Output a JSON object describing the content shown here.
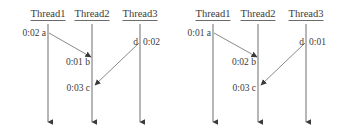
{
  "figure": {
    "type": "thread-timing-diagram-pair",
    "background": "#ffffff",
    "line_color": "#6b6b6b",
    "text_color": "#3b3b3b"
  },
  "diagrams": [
    {
      "id": "left",
      "threads": [
        {
          "label": "Thread1",
          "x": 48
        },
        {
          "label": "Thread2",
          "x": 92
        },
        {
          "label": "Thread3",
          "x": 140
        }
      ],
      "events": [
        {
          "id": "a",
          "time": "0:02",
          "name": "a",
          "thread": "Thread1",
          "side": "left",
          "x": 45,
          "y": 33
        },
        {
          "id": "b",
          "time": "0:01",
          "name": "b",
          "thread": "Thread2",
          "side": "left",
          "x": 89,
          "y": 62
        },
        {
          "id": "c",
          "time": "0:03",
          "name": "c",
          "thread": "Thread2",
          "side": "left",
          "x": 89,
          "y": 88
        },
        {
          "id": "d",
          "time": "0:02",
          "name": "d",
          "thread": "Thread3",
          "side": "split",
          "x": 140,
          "y": 42
        }
      ],
      "messages": [
        {
          "from": "a",
          "to": "b",
          "x1": 49,
          "y1": 33,
          "x2": 91,
          "y2": 57
        },
        {
          "from": "d",
          "to": "c",
          "x1": 139,
          "y1": 43,
          "x2": 95,
          "y2": 85
        }
      ]
    },
    {
      "id": "right",
      "threads": [
        {
          "label": "Thread1",
          "x": 43
        },
        {
          "label": "Thread2",
          "x": 88
        },
        {
          "label": "Thread3",
          "x": 136
        }
      ],
      "events": [
        {
          "id": "a",
          "time": "0:01",
          "name": "a",
          "thread": "Thread1",
          "side": "left",
          "x": 40,
          "y": 33
        },
        {
          "id": "b",
          "time": "0:02",
          "name": "b",
          "thread": "Thread2",
          "side": "left",
          "x": 85,
          "y": 62
        },
        {
          "id": "c",
          "time": "0:03",
          "name": "c",
          "thread": "Thread2",
          "side": "left",
          "x": 85,
          "y": 88
        },
        {
          "id": "d",
          "time": "0:01",
          "name": "d",
          "thread": "Thread3",
          "side": "split",
          "x": 136,
          "y": 42
        }
      ],
      "messages": [
        {
          "from": "a",
          "to": "b",
          "x1": 44,
          "y1": 33,
          "x2": 87,
          "y2": 57
        },
        {
          "from": "d",
          "to": "c",
          "x1": 135,
          "y1": 43,
          "x2": 91,
          "y2": 85
        }
      ]
    }
  ],
  "labels": {
    "d0_left_time": "0:02",
    "d0_left_name": "d",
    "d1_right_time": "0:01",
    "d1_right_name": "d"
  },
  "left": {
    "headers": {
      "t1": "Thread1",
      "t2": "Thread2",
      "t3": "Thread3"
    },
    "a": {
      "text": "0:02  a"
    },
    "b": {
      "text": "0:01  b"
    },
    "c": {
      "text": "0:03  c"
    },
    "d_name": "d",
    "d_time": "0:02"
  },
  "right": {
    "headers": {
      "t1": "Thread1",
      "t2": "Thread2",
      "t3": "Thread3"
    },
    "a": {
      "text": "0:01  a"
    },
    "b": {
      "text": "0:02  b"
    },
    "c": {
      "text": "0:03  c"
    },
    "d_name": "d",
    "d_time": "0:01"
  }
}
